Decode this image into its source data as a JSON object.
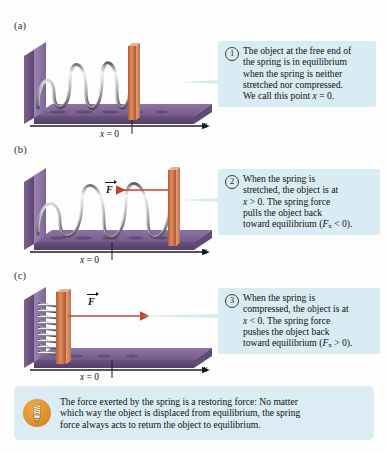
{
  "figure": {
    "colors": {
      "callout_bg": "#daecf3",
      "tip_bg": "#dbecf4",
      "base_purple": "#6f5585",
      "base_purple_light": "#8a6fa0",
      "base_purple_dark": "#4e3b60",
      "block_orange": "#c2673f",
      "block_orange_light": "#d78a5f",
      "spring_silver": "#d8d8dc",
      "spring_dark": "#4a4a50",
      "arrow_red": "#c0442a",
      "bulb_orange": "#e0922f",
      "axis_black": "#1d1d1d"
    }
  },
  "panels": [
    {
      "letter": "(a)",
      "badge": "1",
      "axis_label": "x",
      "origin_label_prefix": "x",
      "origin_label_suffix": " = 0",
      "force_label": "",
      "state": "relaxed",
      "callout_lines": [
        "The object at the free end of",
        "the spring is in equilibrium",
        "when the spring is neither",
        "stretched nor compressed.",
        "We call this point x = 0."
      ]
    },
    {
      "letter": "(b)",
      "badge": "2",
      "axis_label": "x",
      "origin_label_prefix": "x",
      "origin_label_suffix": " = 0",
      "force_label": "F",
      "state": "stretched",
      "callout_lines": [
        "When the spring is",
        "stretched, the object is at",
        "x > 0. The spring force",
        "pulls the object back",
        "toward equilibrium (Fx < 0)."
      ]
    },
    {
      "letter": "(c)",
      "badge": "3",
      "axis_label": "x",
      "origin_label_prefix": "x",
      "origin_label_suffix": " = 0",
      "force_label": "F",
      "state": "compressed",
      "callout_lines": [
        "When the spring is",
        "compressed, the object is at",
        "x < 0. The spring force",
        "pushes the object back",
        "toward equilibrium (Fx > 0)."
      ]
    }
  ],
  "tip": {
    "icon": "lightbulb-icon",
    "lines": [
      "The force exerted by the spring is a restoring force: No matter",
      "which way the object is displaced from equilibrium, the spring",
      "force always acts to return the object to equilibrium."
    ]
  }
}
